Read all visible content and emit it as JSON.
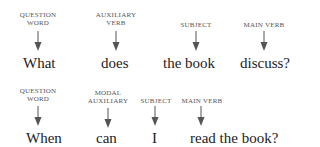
{
  "rows": [
    {
      "items": [
        {
          "label": "QUESTION\nWORD",
          "word": "What"
        },
        {
          "label": "AUXILIARY\nVERB",
          "word": "does"
        },
        {
          "label": "SUBJECT",
          "word": "the book"
        },
        {
          "label": "MAIN VERB",
          "word": "discuss?"
        }
      ]
    },
    {
      "items": [
        {
          "label": "QUESTION\nWORD",
          "word": "When"
        },
        {
          "label": "MODAL\nAUXILIARY",
          "word": "can"
        },
        {
          "label": "SUBJECT",
          "word": "I"
        },
        {
          "label": "MAIN VERB",
          "word": "read the book?"
        }
      ]
    }
  ],
  "arrow_color": "#555555"
}
